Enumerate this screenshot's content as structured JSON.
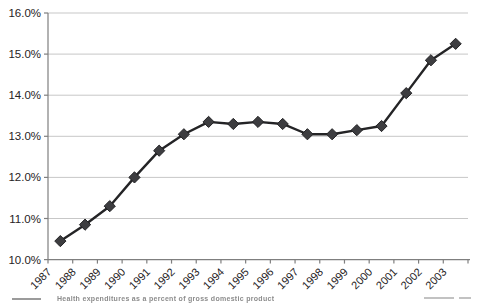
{
  "chart_data": {
    "type": "line",
    "title": "",
    "xlabel": "",
    "ylabel": "",
    "x_categories": [
      "1987",
      "1988",
      "1989",
      "1990",
      "1991",
      "1992",
      "1993",
      "1994",
      "1995",
      "1996",
      "1997",
      "1998",
      "1999",
      "2000",
      "2001",
      "2002",
      "2003"
    ],
    "values": [
      10.45,
      10.85,
      11.3,
      12.0,
      12.65,
      13.05,
      13.35,
      13.3,
      13.35,
      13.3,
      13.05,
      13.05,
      13.15,
      13.25,
      14.05,
      14.85,
      15.25
    ],
    "ylim": [
      10.0,
      16.0
    ],
    "ytick_values": [
      16,
      15,
      14,
      13,
      12,
      11,
      10
    ],
    "ytick_labels": [
      "16.0%",
      "15.0%",
      "14.0%",
      "13.0%",
      "12.0%",
      "11.0%",
      "10.0%"
    ],
    "grid": "horizontal",
    "legend": "none",
    "marker": "diamond",
    "colors": {
      "line": "#242426",
      "marker_fill": "#3d3d40",
      "marker_stroke": "#232325",
      "grid": "#c7c7c7",
      "axis": "#7f7f7f",
      "tick_label": "#262224"
    }
  },
  "caption": {
    "cropped": true,
    "text": "Health expenditures as a percent of gross domestic product"
  }
}
